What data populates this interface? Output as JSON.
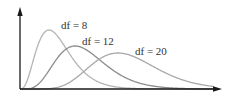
{
  "chart_data": {
    "type": "line",
    "title": "",
    "xlabel": "",
    "ylabel": "",
    "grid": false,
    "legend": "inline labels",
    "series": [
      {
        "name": "df = 8",
        "df": 8,
        "label": "df = 8",
        "color": "#b4b4b4",
        "peak_x_px": 49,
        "peak_y_px": 30
      },
      {
        "name": "df = 12",
        "df": 12,
        "label": "df = 12",
        "color": "#8c8c8c",
        "peak_x_px": 75,
        "peak_y_px": 46
      },
      {
        "name": "df = 20",
        "df": 20,
        "label": "df = 20",
        "color": "#a8a8a8",
        "peak_x_px": 118,
        "peak_y_px": 53
      }
    ]
  },
  "labels": {
    "df8": "df = 8",
    "df12": "df = 12",
    "df20": "df = 20"
  },
  "colors": {
    "axis": "#1a1a1a",
    "df8": "#b4b4b4",
    "df12": "#8c8c8c",
    "df20": "#a8a8a8"
  }
}
